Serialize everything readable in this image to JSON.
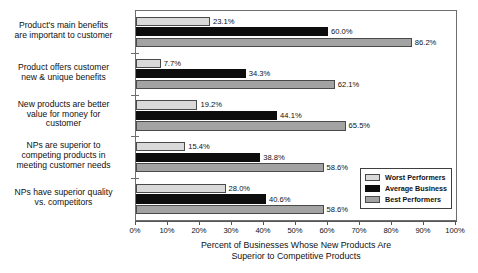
{
  "chart_data": {
    "type": "bar",
    "orientation": "horizontal",
    "title": "",
    "xlabel": "Percent of Businesses Whose New Products Are Superior to Competitive Products",
    "xlabel_line1": "Percent of Businesses Whose New Products Are",
    "xlabel_line2": "Superior to Competitive Products",
    "ylabel": "",
    "xlim": [
      0,
      100
    ],
    "grid": false,
    "legend_position": "inside-lower-right",
    "tick_labels": [
      "0%",
      "10%",
      "20%",
      "30%",
      "40%",
      "50%",
      "60%",
      "70%",
      "80%",
      "90%",
      "100%"
    ],
    "tick_values": [
      0,
      10,
      20,
      30,
      40,
      50,
      60,
      70,
      80,
      90,
      100
    ],
    "categories": [
      "Product's main benefits are important to customer",
      "Product offers customer new & unique benefits",
      "New products are better value for money for customer",
      "NPs are superior to competing products in meeting customer needs",
      "NPs have superior quality vs. competitors"
    ],
    "category_lines": [
      [
        "Product's main benefits",
        "are important to customer"
      ],
      [
        "Product offers customer",
        "new & unique benefits"
      ],
      [
        "New products are better",
        "value for money for",
        "customer"
      ],
      [
        "NPs are superior to",
        "competing products in",
        "meeting customer needs"
      ],
      [
        "NPs have superior quality",
        "vs. competitors"
      ]
    ],
    "series": [
      {
        "name": "Worst Performers",
        "color": "#d9d9d9",
        "values": [
          23.1,
          7.7,
          19.2,
          15.4,
          28.0
        ],
        "labels": [
          "23.1%",
          "7.7%",
          "19.2%",
          "15.4%",
          "28.0%"
        ]
      },
      {
        "name": "Average Business",
        "color": "#0d0d0d",
        "values": [
          60.0,
          34.3,
          44.1,
          38.8,
          40.6
        ],
        "labels": [
          "60.0%",
          "34.3%",
          "44.1%",
          "38.8%",
          "40.6%"
        ]
      },
      {
        "name": "Best Performers",
        "color": "#a3a3a3",
        "values": [
          86.2,
          62.1,
          65.5,
          58.6,
          58.6
        ],
        "labels": [
          "86.2%",
          "62.1%",
          "65.5%",
          "58.6%",
          "58.6%"
        ]
      }
    ]
  }
}
